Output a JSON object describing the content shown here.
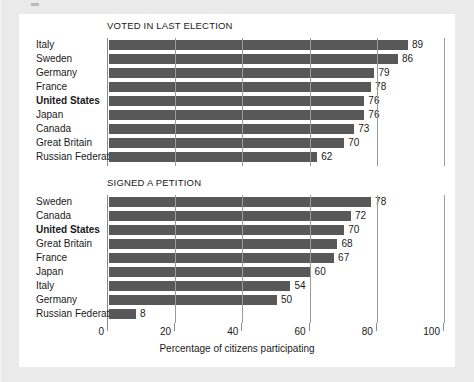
{
  "chart_data": {
    "type": "bar",
    "title": "",
    "xlabel": "Percentage of citizens participating",
    "ylabel": "",
    "xlim": [
      0,
      100
    ],
    "xticks": [
      0,
      20,
      40,
      60,
      80,
      100
    ],
    "xtick_labels": [
      "0",
      "20",
      "40",
      "60",
      "80",
      "100"
    ],
    "grid": true,
    "orientation": "horizontal",
    "legend": "none",
    "highlight_category": "United States",
    "panels": [
      {
        "title": "VOTED IN LAST ELECTION",
        "categories": [
          "Italy",
          "Sweden",
          "Germany",
          "France",
          "United States",
          "Japan",
          "Canada",
          "Great Britain",
          "Russian Federation"
        ],
        "values": [
          89,
          86,
          79,
          78,
          76,
          76,
          73,
          70,
          62
        ]
      },
      {
        "title": "SIGNED A PETITION",
        "categories": [
          "Sweden",
          "Canada",
          "United States",
          "Great Britain",
          "France",
          "Japan",
          "Italy",
          "Germany",
          "Russian Federation"
        ],
        "values": [
          78,
          72,
          70,
          68,
          67,
          60,
          54,
          50,
          8
        ]
      }
    ]
  },
  "colors": {
    "bar": "#585858",
    "grid": "#9a9a9a",
    "axis": "#8c8c8c",
    "panel_bg": "#ffffff",
    "page_bg": "#eaeaea",
    "text": "#1a1a1a"
  },
  "panel_titles": {
    "voted": "VOTED IN LAST ELECTION",
    "petition": "SIGNED A PETITION"
  },
  "axis": {
    "xlabel": "Percentage of citizens participating"
  }
}
